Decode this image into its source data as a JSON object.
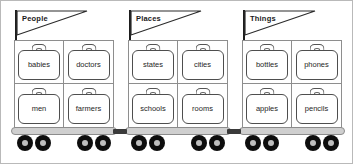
{
  "diagram": {
    "colors": {
      "outline": "#4e4e4e",
      "grid_line": "#8e8e8e",
      "platform": "#cfcfcf",
      "wheel": "#0d0d0d",
      "wheel_hub": "#bfbfbf",
      "coupler": "#3a3a3a",
      "text": "#262626",
      "flag_text": "#1a1a1a",
      "background": "#ffffff",
      "border": "#b9b9b9"
    },
    "carts": [
      {
        "flag_label": "People",
        "icon": "pennant-flag-icon",
        "suitcases": [
          {
            "label": "babies",
            "icon": "suitcase-icon"
          },
          {
            "label": "doctors",
            "icon": "suitcase-icon"
          },
          {
            "label": "men",
            "icon": "suitcase-icon"
          },
          {
            "label": "farmers",
            "icon": "suitcase-icon"
          }
        ]
      },
      {
        "flag_label": "Places",
        "icon": "pennant-flag-icon",
        "suitcases": [
          {
            "label": "states",
            "icon": "suitcase-icon"
          },
          {
            "label": "cities",
            "icon": "suitcase-icon"
          },
          {
            "label": "schools",
            "icon": "suitcase-icon"
          },
          {
            "label": "rooms",
            "icon": "suitcase-icon"
          }
        ]
      },
      {
        "flag_label": "Things",
        "icon": "pennant-flag-icon",
        "suitcases": [
          {
            "label": "bottles",
            "icon": "suitcase-icon"
          },
          {
            "label": "phones",
            "icon": "suitcase-icon"
          },
          {
            "label": "apples",
            "icon": "suitcase-icon"
          },
          {
            "label": "pencils",
            "icon": "suitcase-icon"
          }
        ]
      }
    ]
  }
}
